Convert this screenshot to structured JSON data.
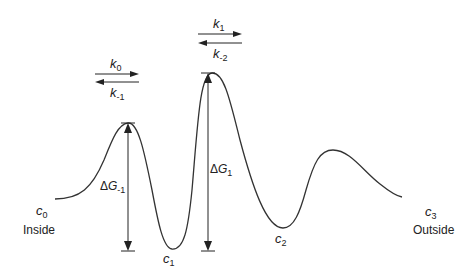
{
  "diagram": {
    "type": "energy-landscape",
    "line_color": "#333333",
    "states": [
      {
        "id": "c0",
        "symbol": "c",
        "subscript": "0",
        "location": "Inside"
      },
      {
        "id": "c1",
        "symbol": "c",
        "subscript": "1"
      },
      {
        "id": "c2",
        "symbol": "c",
        "subscript": "2"
      },
      {
        "id": "c3",
        "symbol": "c",
        "subscript": "3",
        "location": "Outside"
      }
    ],
    "rates": {
      "forward_1": {
        "symbol": "k",
        "subscript": "0"
      },
      "reverse_1": {
        "symbol": "k",
        "subscript": "-1"
      },
      "forward_2": {
        "symbol": "k",
        "subscript": "1"
      },
      "reverse_2": {
        "symbol": "k",
        "subscript": "-2"
      }
    },
    "barriers": {
      "dg_minus1": {
        "delta": "Δ",
        "symbol": "G",
        "subscript": "-1"
      },
      "dg_1": {
        "delta": "Δ",
        "symbol": "G",
        "subscript": "1"
      }
    }
  }
}
